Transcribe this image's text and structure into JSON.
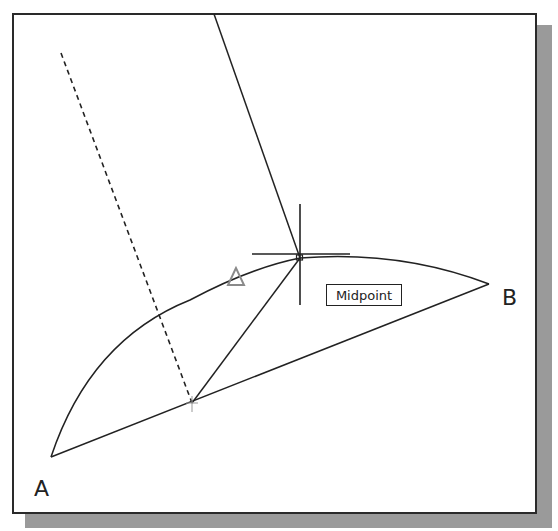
{
  "diagram": {
    "labels": {
      "point_a": "A",
      "point_b": "B"
    },
    "tooltip": {
      "text": "Midpoint"
    },
    "points": {
      "A": [
        51,
        457
      ],
      "B": [
        489,
        284
      ],
      "arc_midpoint": [
        300,
        258
      ],
      "chord_midpoint": [
        192,
        403
      ]
    },
    "colors": {
      "line": "#222222",
      "frame": "#2a2a2a",
      "shadow": "#9a9a9a",
      "marker": "#8a8a8a",
      "background": "#ffffff"
    }
  }
}
